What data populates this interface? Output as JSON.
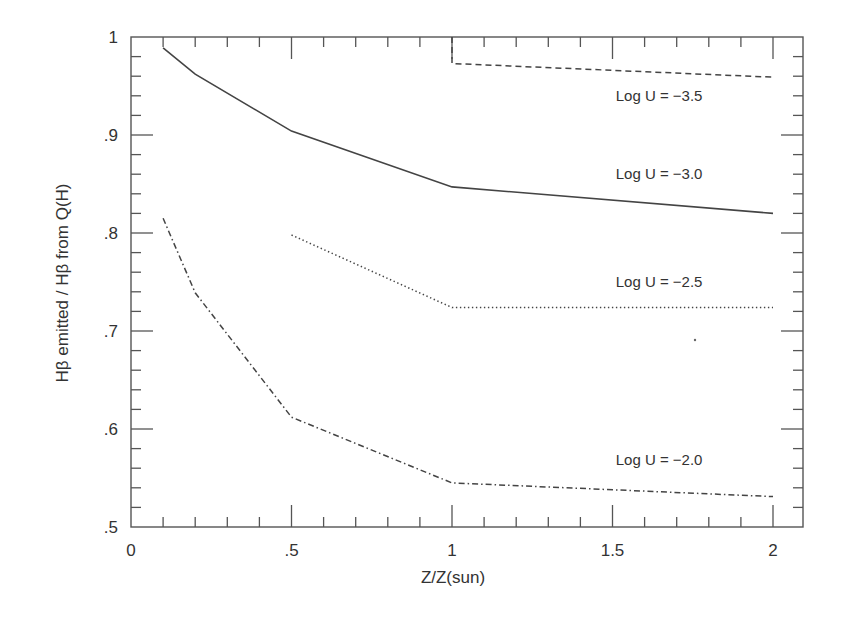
{
  "chart_data": {
    "type": "line",
    "title": "",
    "xlabel": "Z/Z(sun)",
    "ylabel": "Hβ emitted / Hβ from Q(H)",
    "xlim": [
      0,
      2.1
    ],
    "ylim": [
      0.5,
      1.0
    ],
    "grid": false,
    "legend": "inline labels on right",
    "x_ticks": [
      {
        "value": 0,
        "label": "0"
      },
      {
        "value": 0.5,
        "label": ".5"
      },
      {
        "value": 1,
        "label": "1"
      },
      {
        "value": 1.5,
        "label": "1.5"
      },
      {
        "value": 2,
        "label": "2"
      }
    ],
    "y_ticks": [
      {
        "value": 0.5,
        "label": ".5"
      },
      {
        "value": 0.6,
        "label": ".6"
      },
      {
        "value": 0.7,
        "label": ".7"
      },
      {
        "value": 0.8,
        "label": ".8"
      },
      {
        "value": 0.9,
        "label": ".9"
      },
      {
        "value": 1.0,
        "label": "1"
      }
    ],
    "x_minor_step": 0.1,
    "y_minor_step": 0.02,
    "series": [
      {
        "name": "Log U = −3.5",
        "style": "dashed",
        "x": [
          1,
          2
        ],
        "values": [
          0.973,
          0.959
        ],
        "label_pos": {
          "x": 1.51,
          "y": 0.935
        }
      },
      {
        "name": "Log U = −3.0",
        "style": "solid",
        "x": [
          0.1,
          0.2,
          0.5,
          1,
          2
        ],
        "values": [
          0.989,
          0.962,
          0.904,
          0.847,
          0.82
        ],
        "label_pos": {
          "x": 1.51,
          "y": 0.855
        }
      },
      {
        "name": "Log U = −2.5",
        "style": "dotted",
        "x": [
          0.5,
          1,
          2
        ],
        "values": [
          0.798,
          0.724,
          0.724
        ],
        "label_pos": {
          "x": 1.51,
          "y": 0.745
        }
      },
      {
        "name": "Log U = −2.0",
        "style": "dashdot",
        "x": [
          0.1,
          0.2,
          0.5,
          1,
          2
        ],
        "values": [
          0.815,
          0.739,
          0.612,
          0.545,
          0.531
        ],
        "label_pos": {
          "x": 1.51,
          "y": 0.563
        }
      }
    ]
  },
  "colors": {
    "axis": "#555555",
    "line": "#444444",
    "text": "#333333"
  }
}
